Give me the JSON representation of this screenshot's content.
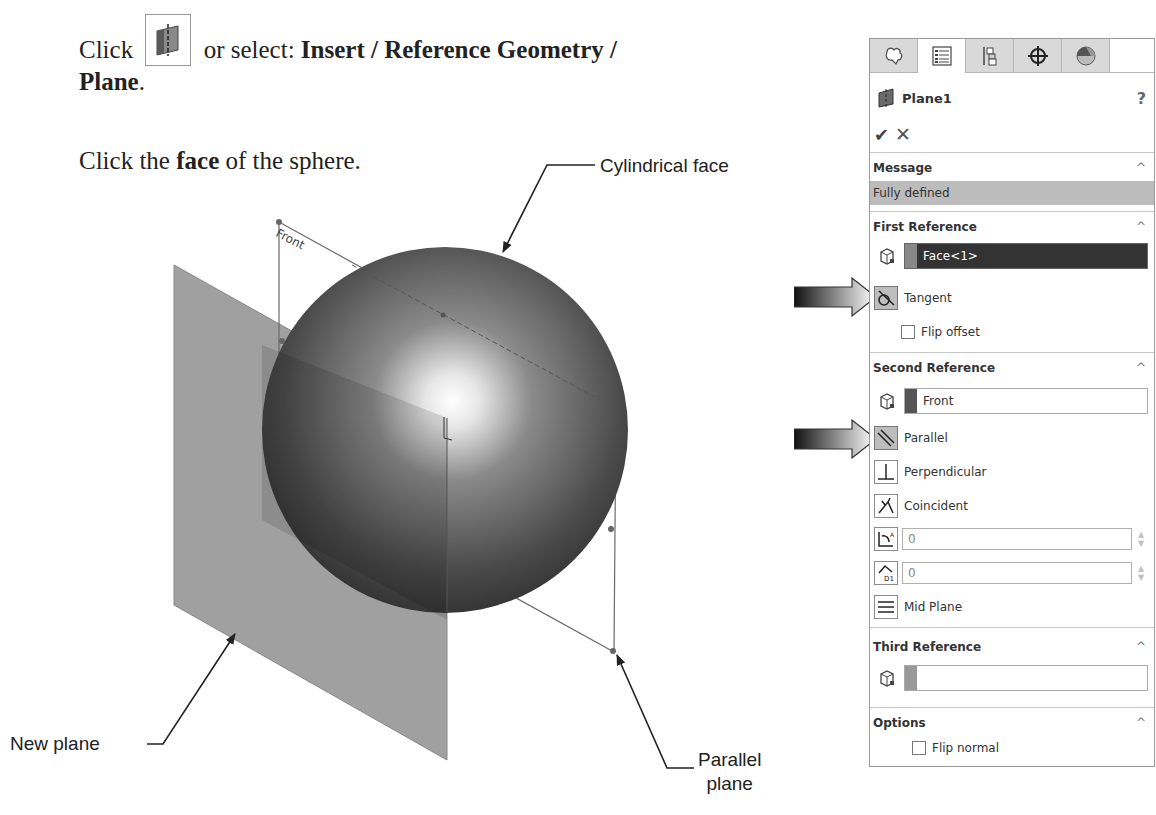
{
  "instructions": {
    "line1_prefix": "Click",
    "line1_mid": "or select:",
    "menu_path": "Insert / Reference Geometry /",
    "menu_path_end": "Plane",
    "period": ".",
    "line2_prefix": "Click the",
    "line2_bold": "face",
    "line2_suffix": "of the sphere.",
    "tool_icon": "reference-plane-icon"
  },
  "illustration": {
    "callouts": {
      "cylindrical_face": "Cylindrical face",
      "new_plane": "New plane",
      "parallel_plane_line1": "Parallel",
      "parallel_plane_line2": "plane"
    },
    "front_plane_label": "Front",
    "colors": {
      "plane_fill": "#9a9a9a",
      "sphere_dark": "#3a3a3a",
      "sphere_highlight": "#ffffff"
    }
  },
  "panel": {
    "tabs": [
      {
        "name": "feature-manager",
        "icon": "feature-tree-icon",
        "active": false
      },
      {
        "name": "property-manager",
        "icon": "property-list-icon",
        "active": true
      },
      {
        "name": "configuration-manager",
        "icon": "configuration-icon",
        "active": false
      },
      {
        "name": "dimxpert-manager",
        "icon": "crosshair-icon",
        "active": false
      },
      {
        "name": "display-manager",
        "icon": "appearance-sphere-icon",
        "active": false
      }
    ],
    "title": "Plane1",
    "help": "?",
    "ok": "✔",
    "cancel": "✕",
    "message": {
      "header": "Message",
      "text": "Fully defined"
    },
    "first_reference": {
      "header": "First Reference",
      "selection": "Face<1>",
      "constraint": "Tangent",
      "flip_offset": "Flip offset"
    },
    "second_reference": {
      "header": "Second Reference",
      "selection": "Front",
      "options": [
        "Parallel",
        "Perpendicular",
        "Coincident"
      ],
      "angle_value": "0",
      "distance_value": "0",
      "mid_plane": "Mid Plane"
    },
    "third_reference": {
      "header": "Third Reference",
      "selection": ""
    },
    "options": {
      "header": "Options",
      "flip_normal": "Flip normal"
    },
    "chevron": "^"
  }
}
